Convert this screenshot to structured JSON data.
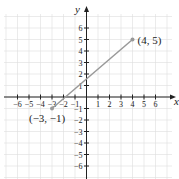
{
  "chart_data": {
    "type": "line",
    "title": "",
    "xlabel": "x",
    "ylabel": "y",
    "xlim": [
      -6,
      6
    ],
    "ylim": [
      -6,
      6
    ],
    "x_ticks": [
      -6,
      -5,
      -4,
      -3,
      -2,
      -1,
      1,
      2,
      3,
      4,
      5,
      6
    ],
    "y_ticks": [
      -6,
      -5,
      -4,
      -3,
      -2,
      -1,
      1,
      2,
      3,
      4,
      5,
      6
    ],
    "grid": true,
    "series": [
      {
        "name": "segment",
        "x": [
          -3,
          4
        ],
        "y": [
          -1,
          5
        ],
        "color": "#999999"
      }
    ],
    "annotations": [
      {
        "text": "(4, 5)",
        "x": 4,
        "y": 5
      },
      {
        "text": "(−3, −1)",
        "x": -3,
        "y": -1
      }
    ]
  },
  "style": {
    "line_color": "#999999",
    "axis_color": "#222222",
    "grid_color": "#dddddd"
  }
}
